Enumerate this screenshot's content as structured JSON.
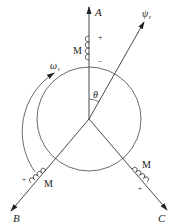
{
  "diagram": {
    "type": "three-phase-winding-axes",
    "axes": {
      "a": {
        "label": "A"
      },
      "b": {
        "label": "B"
      },
      "c": {
        "label": "C"
      },
      "flux": {
        "label": "ψ",
        "subscript": "r"
      }
    },
    "angle": {
      "label": "θ"
    },
    "rotation": {
      "label": "ω",
      "subscript": "r"
    },
    "coils": [
      {
        "phase": "A",
        "label": "M",
        "plus": "+",
        "minus": "−"
      },
      {
        "phase": "B",
        "label": "M",
        "plus": "+",
        "minus": "−"
      },
      {
        "phase": "C",
        "label": "M",
        "plus": "+",
        "minus": "−"
      }
    ],
    "colors": {
      "line": "#333333",
      "background": "#ffffff"
    }
  }
}
